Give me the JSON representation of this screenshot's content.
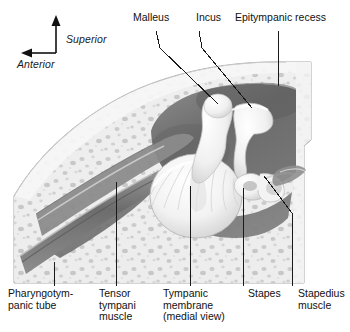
{
  "figure": {
    "view": "medial view",
    "style": "grayscale anatomical illustration",
    "orientation": {
      "vertical_axis_label": "Superior",
      "horizontal_axis_label": "Anterior",
      "vertical_arrow_direction": "up",
      "horizontal_arrow_direction": "left"
    }
  },
  "labels": {
    "malleus": "Malleus",
    "incus": "Incus",
    "epitympanic_recess": "Epitympanic recess",
    "pharyngotympanic_tube_line1": "Pharyngotym-",
    "pharyngotympanic_tube_line2": "panic tube",
    "tensor_tympani_line1": "Tensor",
    "tensor_tympani_line2": "tympani",
    "tensor_tympani_line3": "muscle",
    "tympanic_membrane_line1": "Tympanic",
    "tympanic_membrane_line2": "membrane",
    "tympanic_membrane_line3": "(medial view)",
    "stapes": "Stapes",
    "stapedius_line1": "Stapedius",
    "stapedius_line2": "muscle"
  },
  "structures": [
    {
      "name": "Malleus",
      "position": "top-center",
      "leader": "diagonal down-right"
    },
    {
      "name": "Incus",
      "position": "top-center-right",
      "leader": "diagonal down-right"
    },
    {
      "name": "Epitympanic recess",
      "position": "top-right",
      "leader": "vertical"
    },
    {
      "name": "Pharyngotympanic tube",
      "position": "bottom-left",
      "leader": "vertical"
    },
    {
      "name": "Tensor tympani muscle",
      "position": "bottom-left-center",
      "leader": "vertical"
    },
    {
      "name": "Tympanic membrane (medial view)",
      "position": "bottom-center",
      "leader": "vertical"
    },
    {
      "name": "Stapes",
      "position": "bottom-right-center",
      "leader": "vertical"
    },
    {
      "name": "Stapedius muscle",
      "position": "bottom-right",
      "leader": "vertical with diagonal tip"
    }
  ],
  "colors": {
    "background": "#ffffff",
    "text": "#111111",
    "leader_line": "#1a1a1a",
    "bone_light": "#ededed",
    "bone_mid": "#d8d8d8",
    "cavity_dark": "#6f6f6f",
    "cavity_darkest": "#585858",
    "ossicle_white": "#fbfbfb",
    "outline": "#9a9a9a"
  }
}
